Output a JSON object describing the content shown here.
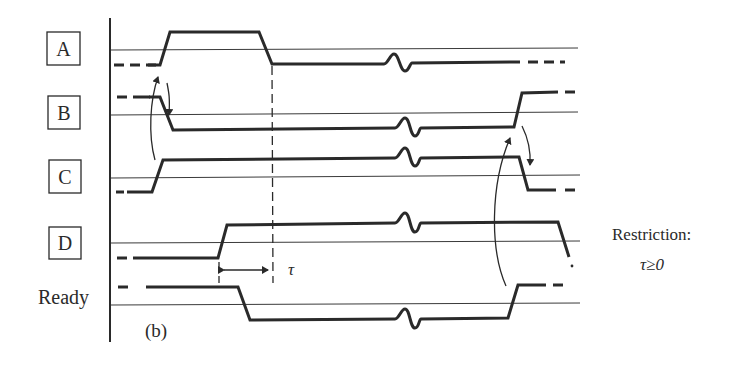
{
  "diagram": {
    "panel_label": "(b)",
    "signals": [
      {
        "name": "A",
        "boxed": true
      },
      {
        "name": "B",
        "boxed": true
      },
      {
        "name": "C",
        "boxed": true
      },
      {
        "name": "D",
        "boxed": true
      },
      {
        "name": "Ready",
        "boxed": false
      }
    ],
    "tau_label": "τ",
    "restriction": {
      "label": "Restriction:",
      "condition": "τ≥0"
    }
  }
}
